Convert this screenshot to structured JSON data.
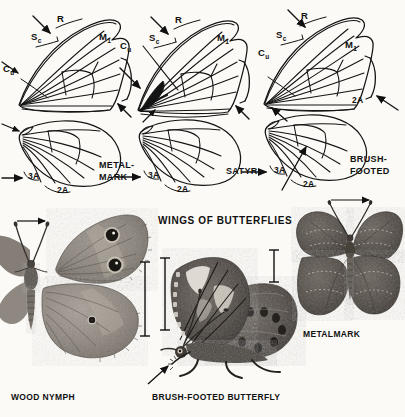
{
  "plate": {
    "title": "WINGS OF BUTTERFLIES",
    "background_color": "#fbfaf7",
    "ink_color": "#171717"
  },
  "wing_diagrams": [
    {
      "family": "METAL-MARK",
      "family_label_line1": "METAL-",
      "family_label_line2": "MARK",
      "forewing_vein_labels": [
        "R",
        "Sc",
        "M",
        "Cu"
      ],
      "forewing_m_subscript": "1",
      "hindwing_vein_labels": [
        "3A",
        "2A"
      ]
    },
    {
      "family": "SATYR",
      "family_label_line1": "SATYR",
      "family_label_line2": "",
      "forewing_vein_labels": [
        "R",
        "Sc",
        "M",
        "Cu"
      ],
      "forewing_m_subscript": "1",
      "hindwing_vein_labels": [
        "3A",
        "2A"
      ]
    },
    {
      "family": "BRUSH-FOOTED",
      "family_label_line1": "BRUSH-",
      "family_label_line2": "FOOTED",
      "forewing_vein_labels": [
        "R",
        "Sc",
        "M",
        "Cu",
        "2A"
      ],
      "forewing_m_subscript": "1",
      "hindwing_vein_labels": [
        "3A",
        "2A"
      ]
    }
  ],
  "vein_labels": {
    "radius": "R",
    "subcosta_main": "S",
    "subcosta_sub": "c",
    "media_main": "M",
    "media_sub": "1",
    "cubitus_main": "C",
    "cubitus_sub": "u",
    "anal_2": "2A",
    "anal_3": "3A"
  },
  "specimens": [
    {
      "name": "WOOD NYMPH",
      "label": "WOOD NYMPH"
    },
    {
      "name": "BRUSH-FOOTED BUTTERFLY",
      "label": "BRUSH-FOOTED BUTTERFLY"
    },
    {
      "name": "METALMARK",
      "label": "METALMARK"
    }
  ]
}
